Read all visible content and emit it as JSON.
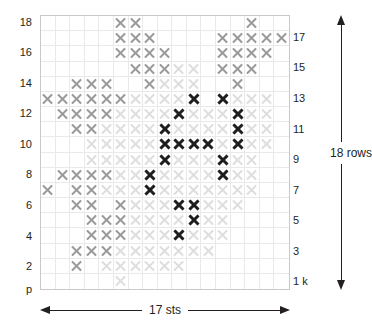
{
  "chart_data": {
    "type": "heatmap",
    "title": "",
    "xlabel": "17 sts",
    "ylabel": "18 rows",
    "columns": 17,
    "rows": 18,
    "grid": true,
    "legend": [
      {
        "key": "dark",
        "label": "dark X",
        "color": "#1e1e1e"
      },
      {
        "key": "mid",
        "label": "gray X",
        "color": "#9a9a9a"
      },
      {
        "key": "light",
        "label": "pale X",
        "color": "#dedede"
      },
      {
        "key": "none",
        "label": "empty",
        "color": "#ffffff"
      }
    ],
    "row_order_top_to_bottom": [
      18,
      17,
      16,
      15,
      14,
      13,
      12,
      11,
      10,
      9,
      8,
      7,
      6,
      5,
      4,
      3,
      2,
      1
    ],
    "cells": [
      [
        "none",
        "none",
        "none",
        "none",
        "none",
        "mid",
        "mid",
        "none",
        "none",
        "none",
        "none",
        "none",
        "none",
        "none",
        "mid",
        "none",
        "none"
      ],
      [
        "none",
        "none",
        "none",
        "none",
        "none",
        "mid",
        "mid",
        "mid",
        "none",
        "none",
        "none",
        "none",
        "mid",
        "mid",
        "mid",
        "mid",
        "mid"
      ],
      [
        "none",
        "none",
        "none",
        "none",
        "none",
        "mid",
        "mid",
        "mid",
        "mid",
        "none",
        "none",
        "none",
        "mid",
        "mid",
        "mid",
        "mid",
        "none"
      ],
      [
        "none",
        "none",
        "none",
        "none",
        "none",
        "none",
        "mid",
        "mid",
        "mid",
        "light",
        "light",
        "none",
        "mid",
        "mid",
        "mid",
        "none",
        "none"
      ],
      [
        "none",
        "none",
        "mid",
        "mid",
        "mid",
        "none",
        "none",
        "mid",
        "light",
        "light",
        "light",
        "none",
        "none",
        "mid",
        "none",
        "none",
        "none"
      ],
      [
        "mid",
        "mid",
        "mid",
        "mid",
        "mid",
        "mid",
        "light",
        "light",
        "light",
        "light",
        "dark",
        "none",
        "dark",
        "light",
        "light",
        "light",
        "none"
      ],
      [
        "none",
        "mid",
        "mid",
        "mid",
        "mid",
        "light",
        "light",
        "light",
        "light",
        "dark",
        "light",
        "light",
        "light",
        "dark",
        "light",
        "light",
        "none"
      ],
      [
        "none",
        "none",
        "mid",
        "mid",
        "light",
        "light",
        "light",
        "light",
        "dark",
        "light",
        "light",
        "light",
        "light",
        "dark",
        "light",
        "light",
        "none"
      ],
      [
        "none",
        "none",
        "none",
        "light",
        "light",
        "light",
        "light",
        "light",
        "dark",
        "dark",
        "dark",
        "dark",
        "light",
        "dark",
        "light",
        "light",
        "none"
      ],
      [
        "none",
        "none",
        "none",
        "light",
        "light",
        "light",
        "light",
        "light",
        "dark",
        "light",
        "light",
        "light",
        "dark",
        "light",
        "light",
        "none",
        "none"
      ],
      [
        "none",
        "mid",
        "mid",
        "mid",
        "mid",
        "light",
        "light",
        "dark",
        "light",
        "light",
        "light",
        "light",
        "dark",
        "light",
        "light",
        "none",
        "none"
      ],
      [
        "mid",
        "none",
        "mid",
        "mid",
        "light",
        "light",
        "light",
        "dark",
        "light",
        "light",
        "light",
        "light",
        "light",
        "light",
        "light",
        "none",
        "none"
      ],
      [
        "none",
        "none",
        "mid",
        "mid",
        "none",
        "mid",
        "light",
        "light",
        "light",
        "dark",
        "dark",
        "light",
        "light",
        "light",
        "none",
        "none",
        "none"
      ],
      [
        "none",
        "none",
        "none",
        "mid",
        "mid",
        "mid",
        "light",
        "light",
        "light",
        "light",
        "dark",
        "light",
        "light",
        "none",
        "none",
        "none",
        "none"
      ],
      [
        "none",
        "none",
        "none",
        "mid",
        "mid",
        "mid",
        "light",
        "light",
        "light",
        "dark",
        "light",
        "light",
        "light",
        "none",
        "none",
        "none",
        "none"
      ],
      [
        "none",
        "none",
        "mid",
        "mid",
        "mid",
        "light",
        "light",
        "light",
        "light",
        "light",
        "light",
        "light",
        "none",
        "none",
        "none",
        "none",
        "none"
      ],
      [
        "none",
        "none",
        "mid",
        "none",
        "light",
        "light",
        "light",
        "light",
        "light",
        "light",
        "none",
        "none",
        "none",
        "none",
        "none",
        "none",
        "none"
      ],
      [
        "none",
        "none",
        "none",
        "none",
        "none",
        "light",
        "none",
        "none",
        "none",
        "none",
        "none",
        "none",
        "none",
        "none",
        "none",
        "none",
        "none"
      ]
    ]
  },
  "labels": {
    "left": [
      {
        "row": 18,
        "text": "18"
      },
      {
        "row": 16,
        "text": "16"
      },
      {
        "row": 14,
        "text": "14"
      },
      {
        "row": 12,
        "text": "12"
      },
      {
        "row": 10,
        "text": "10"
      },
      {
        "row": 8,
        "text": "8"
      },
      {
        "row": 6,
        "text": "6"
      },
      {
        "row": 4,
        "text": "4"
      },
      {
        "row": 2,
        "text": "2"
      },
      {
        "row": 0,
        "text": "p"
      }
    ],
    "right": [
      {
        "row": 17,
        "text": "17"
      },
      {
        "row": 15,
        "text": "15"
      },
      {
        "row": 13,
        "text": "13"
      },
      {
        "row": 11,
        "text": "11"
      },
      {
        "row": 9,
        "text": "9"
      },
      {
        "row": 7,
        "text": "7"
      },
      {
        "row": 5,
        "text": "5"
      },
      {
        "row": 3,
        "text": "3"
      },
      {
        "row": 1,
        "text": "1 k"
      }
    ]
  },
  "annotations": {
    "width_caption": "17 sts",
    "height_caption": "18 rows"
  }
}
